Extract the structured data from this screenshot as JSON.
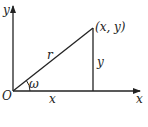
{
  "diagram": {
    "axes": {
      "x_label": "x",
      "y_label": "y",
      "origin_label": "O"
    },
    "point_label": "(x, y)",
    "hypotenuse_label": "r",
    "vertical_leg_label": "y",
    "horizontal_leg_label": "x",
    "angle_label": "ω",
    "colors": {
      "stroke": "#222222",
      "background": "#ffffff"
    }
  }
}
